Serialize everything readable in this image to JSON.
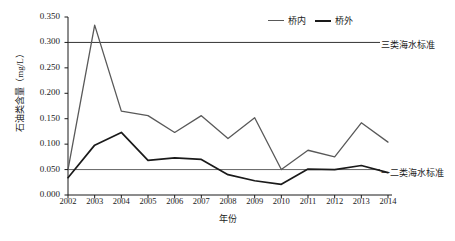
{
  "chart_data": {
    "type": "line",
    "title": "",
    "xlabel": "年份",
    "ylabel": "石油类含量（mg/L）",
    "categories": [
      "2002",
      "2003",
      "2004",
      "2005",
      "2006",
      "2007",
      "2008",
      "2009",
      "2010",
      "2011",
      "2012",
      "2013",
      "2014"
    ],
    "ylim": [
      0.0,
      0.35
    ],
    "ytick_labels": [
      "0.350",
      "0.300",
      "0.250",
      "0.200",
      "0.150",
      "0.100",
      "0.050",
      "0.000"
    ],
    "ytick_values": [
      0.35,
      0.3,
      0.25,
      0.2,
      0.15,
      0.1,
      0.05,
      0.0
    ],
    "grid": false,
    "legend_position": "top-right",
    "series": [
      {
        "name": "桥内",
        "color": "#595959",
        "values": [
          0.05,
          0.334,
          0.165,
          0.156,
          0.123,
          0.156,
          0.111,
          0.152,
          0.05,
          0.088,
          0.075,
          0.142,
          0.104
        ]
      },
      {
        "name": "桥外",
        "color": "#1a1a1a",
        "values": [
          0.034,
          0.098,
          0.123,
          0.068,
          0.073,
          0.07,
          0.04,
          0.028,
          0.021,
          0.051,
          0.05,
          0.058,
          0.044
        ]
      }
    ],
    "reference_lines": [
      {
        "label": "三类海水标准",
        "value": 0.3,
        "color": "#333333"
      },
      {
        "label": "一二类海水标准",
        "value": 0.05,
        "color": "#666666"
      }
    ],
    "annotations": [
      "三类海水标准",
      "一二类海水标准"
    ]
  },
  "legend": {
    "items": [
      {
        "label": "桥内"
      },
      {
        "label": "桥外"
      }
    ]
  },
  "axes": {
    "y_title": "石油类含量（mg/L）",
    "x_title": "年份"
  }
}
